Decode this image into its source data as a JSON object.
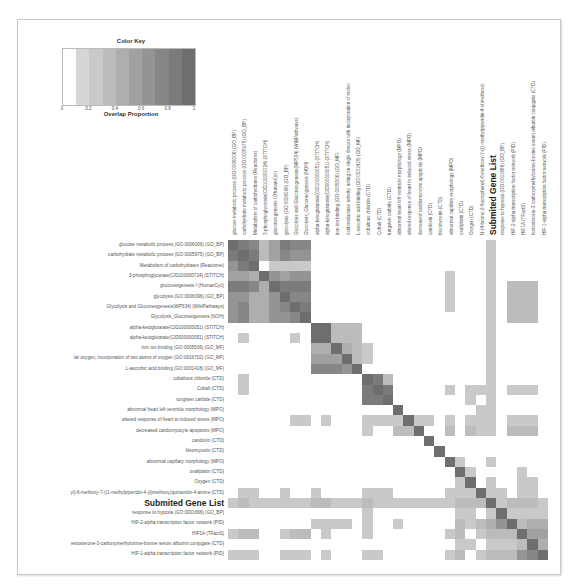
{
  "color_key": {
    "title": "Color Key",
    "xlabel": "Overlap Proportion",
    "ticks": [
      "0",
      "0.2",
      "0.4",
      "0.6",
      "0.8",
      "1"
    ],
    "bins": [
      "#ffffff",
      "#d6d6d6",
      "#c9c9c9",
      "#bcbcbc",
      "#aeaeae",
      "#a1a1a1",
      "#949494",
      "#878787",
      "#7b7b7b",
      "#6e6e6e"
    ]
  },
  "chart_data": {
    "type": "heatmap",
    "title": "",
    "xlabel": "",
    "ylabel": "",
    "legend": {
      "title": "Color Key",
      "label": "Overlap Proportion",
      "range": [
        0,
        1
      ],
      "position": "top-left"
    },
    "labels": [
      "glucose metabolic process (GO:0006006) (GO_BP)",
      "carbohydrate metabolic process (GO:0005975) (GO_BP)",
      "Metabolism of carbohydrates (Reactome)",
      "3-phosphoglycerate(CID100000724) (STITCH)",
      "gluconeogenesis I (HumanCyc)",
      "glycolysis (GO:0006096) (GO_BP)",
      "Glycolysis and Gluconeogenesis(WP534) (WikiPathways)",
      "Glycolysis_Gluconeogenesis (NOH)",
      "alpha-ketoglutarate(CID100000051) (STITCH)",
      "alpha-ketoglutarate(CID000000051) (STITCH)",
      "iron ion binding (GO:0005506) (GO_MF)",
      "oxidoreductase activity, acting on single donors with incorporation of molecular oxygen, incorporation of two atoms of oxygen (GO:0016702) (GO_MF)",
      "L-ascorbic acid binding (GO:0031418) (GO_MF)",
      "cobaltous chloride (CTD)",
      "Cobalt (CTD)",
      "tungsten carbide (CTD)",
      "abnormal heart left ventricle morphology (MPO)",
      "altered response of heart to induced stress (MPO)",
      "decreased cardiomyocyte apoptosis (MPO)",
      "candoxin (CTD)",
      "bleomycetin (CTD)",
      "abnormal capillary morphology (MPO)",
      "oxaliplatin (CTD)",
      "Oxygen (CTD)",
      "N-(4-bromo-2-fluorophenyl)-6-methoxy-7-((1-methylpiperidin-4-yl)methoxy)quinazolin-4-amine (CTD)",
      "Submited Gene List",
      "response to hypoxia (GO:0001666) (GO_BP)",
      "HIF-2-alpha transcription factor network (PID)",
      "HIF1A (TFactS)",
      "testosterone-3-carboxymethyloxime-bovine serum albumin conjugate (CTD)",
      "HIF-1-alpha transcription factor network (PID)"
    ],
    "row_labels_display": [
      "glucose metabolic process (GO:0006006) (GO_BP)",
      "carbohydrate metabolic process (GO:0005975) (GO_BP)",
      "Metabolism of carbohydrates (Reactome)",
      "3-phosphoglycerate(CID100000724) (STITCH)",
      "gluconeogenesis I (HumanCyc)",
      "glycolysis (GO:0006096) (GO_BP)",
      "Glycolysis and Gluconeogenesis(WP534) (WikiPathways)",
      "Glycolysis_Gluconeogenesis (NOH)",
      "alpha-ketoglutarate(CID100000051) (STITCH)",
      "alpha-ketoglutarate(CID000000051) (STITCH)",
      "iron ion binding (GO:0005506) (GO_MF)",
      "lar oxygen, incorporation of two atoms of oxygen (GO:0016702) (GO_MF)",
      "L-ascorbic acid binding (GO:0031418) (GO_MF)",
      "cobaltous chloride (CTD)",
      "Cobalt (CTD)",
      "tungsten carbide (CTD)",
      "abnormal heart left ventricle morphology (MPO)",
      "altered response of heart to induced stress (MPO)",
      "decreased cardiomyocyte apoptosis (MPO)",
      "candoxin (CTD)",
      "bleomycetin (CTD)",
      "abnormal capillary morphology (MPO)",
      "oxaliplatin (CTD)",
      "Oxygen (CTD)",
      "yl)-6-methoxy-7-((1-methylpiperidin-4-yl)methoxy)quinazolin-4-amine (CTD)",
      "Submited Gene List",
      "response to hypoxia (GO:0001666) (GO_BP)",
      "HIF-2-alpha transcription factor network (PID)",
      "HIF1A (TFactS)",
      "estosterone-3-carboxymethyloxime-bovine serum albumin conjugate (CTD)",
      "HIF-1-alpha transcription factor network (PID)"
    ],
    "col_labels_display": [
      "glucose metabolic process (GO:0006006) (GO_BP)",
      "carbohydrate metabolic process (GO:0005975) (GO_BP)",
      "Metabolism of carbohydrates (Reactome)",
      "3-phosphoglycerate(CID100000724) (STITCH)",
      "gluconeogenesis I (HumanCyc)",
      "glycolysis (GO:0006096) (GO_BP)",
      "Glycolysis and Gluconeogenesis(WP534) (WikiPathways)",
      "Glycolysis_Gluconeogenesis (NOH)",
      "alpha-ketoglutarate(CID100000051) (STITCH)",
      "alpha-ketoglutarate(CID000000051) (STITCH)",
      "iron ion binding (GO:0005506) (GO_MF)",
      "oxidoreductase activity, acting on single donors with incorporation of molec",
      "L-ascorbic acid binding (GO:0031418) (GO_MF)",
      "cobaltous chloride (CTD)",
      "Cobalt (CTD)",
      "tungsten carbide (CTD)",
      "abnormal heart left ventricle morphology (MPO)",
      "altered response of heart to induced stress (MPO)",
      "decreased cardiomyocyte apoptosis (MPO)",
      "candoxin (CTD)",
      "bleomycetin (CTD)",
      "abnormal capillary morphology (MPO)",
      "oxaliplatin (CTD)",
      "Oxygen (CTD)",
      "N-(4-bromo-2-fluorophenyl)-6-methoxy-7-((1-methylpiperidin-4-yl)methoxy)",
      "Submited Gene List",
      "response to hypoxia (GO:0001666) (GO_BP)",
      "HIF-2-alpha transcription factor network (PID)",
      "HIF1A (TFactS)",
      "testosterone-3-carboxymethyloxime-bovine serum albumin conjugate (CTD)",
      "HIF-1-alpha transcription factor network (PID)"
    ],
    "highlight_label": "Submited Gene List",
    "values": [
      [
        1.0,
        0.8,
        0.7,
        0.3,
        0.5,
        0.8,
        0.7,
        0.7,
        0,
        0,
        0,
        0,
        0,
        0,
        0,
        0,
        0,
        0,
        0,
        0,
        0,
        0,
        0,
        0,
        0,
        0.2,
        0,
        0,
        0,
        0,
        0
      ],
      [
        0.8,
        1.0,
        0.8,
        0.3,
        0.5,
        0.7,
        0.6,
        0.6,
        0,
        0,
        0,
        0,
        0,
        0,
        0,
        0,
        0,
        0,
        0,
        0,
        0,
        0,
        0,
        0,
        0,
        0.2,
        0,
        0,
        0,
        0,
        0
      ],
      [
        0.6,
        0.8,
        1.0,
        0,
        0.2,
        0.2,
        0.2,
        0.2,
        0,
        0,
        0,
        0,
        0,
        0,
        0,
        0,
        0,
        0,
        0,
        0,
        0,
        0,
        0,
        0,
        0,
        0.2,
        0,
        0,
        0,
        0,
        0
      ],
      [
        0.5,
        0.5,
        0.4,
        1.0,
        0.6,
        0.5,
        0.6,
        0.6,
        0,
        0,
        0,
        0,
        0,
        0,
        0,
        0,
        0,
        0,
        0,
        0,
        0,
        0.2,
        0,
        0,
        0,
        0.2,
        0,
        0,
        0,
        0,
        0
      ],
      [
        0.8,
        0.8,
        0.7,
        0.4,
        1.0,
        0.8,
        0.8,
        0.8,
        0,
        0,
        0,
        0,
        0,
        0,
        0,
        0,
        0,
        0,
        0,
        0,
        0,
        0.2,
        0,
        0,
        0,
        0.2,
        0,
        0.3,
        0.3,
        0.3,
        0
      ],
      [
        0.6,
        0.6,
        0.4,
        0.4,
        0.6,
        1.0,
        0.7,
        0.7,
        0,
        0,
        0,
        0,
        0,
        0,
        0,
        0,
        0,
        0,
        0,
        0,
        0,
        0.2,
        0,
        0,
        0,
        0.2,
        0,
        0.3,
        0.3,
        0.3,
        0
      ],
      [
        0.6,
        0.7,
        0.4,
        0.4,
        0.6,
        0.7,
        1.0,
        0.8,
        0,
        0,
        0,
        0,
        0,
        0,
        0,
        0,
        0,
        0,
        0,
        0,
        0,
        0.2,
        0,
        0,
        0,
        0.2,
        0,
        0.3,
        0.3,
        0.3,
        0
      ],
      [
        0.6,
        0.7,
        0.4,
        0.4,
        0.6,
        0.6,
        0.7,
        1.0,
        0,
        0,
        0,
        0,
        0,
        0,
        0,
        0,
        0,
        0,
        0,
        0,
        0,
        0,
        0,
        0,
        0,
        0.2,
        0,
        0.3,
        0.3,
        0.3,
        0
      ],
      [
        0,
        0,
        0,
        0,
        0,
        0,
        0,
        0,
        1.0,
        0.9,
        0.3,
        0.3,
        0.3,
        0,
        0,
        0,
        0,
        0,
        0,
        0,
        0,
        0,
        0,
        0,
        0,
        0.2,
        0,
        0,
        0,
        0,
        0
      ],
      [
        0,
        0.2,
        0,
        0,
        0,
        0,
        0.2,
        0,
        0.9,
        1.0,
        0.3,
        0.3,
        0.3,
        0,
        0,
        0,
        0,
        0,
        0,
        0,
        0,
        0,
        0,
        0,
        0,
        0.2,
        0,
        0,
        0,
        0,
        0
      ],
      [
        0,
        0,
        0,
        0,
        0,
        0,
        0,
        0,
        0.4,
        0.4,
        1.0,
        0.4,
        0.3,
        0.2,
        0,
        0,
        0,
        0,
        0,
        0,
        0,
        0,
        0,
        0,
        0,
        0.2,
        0,
        0,
        0,
        0,
        0
      ],
      [
        0,
        0,
        0,
        0,
        0,
        0,
        0,
        0,
        0.5,
        0.5,
        0.5,
        1.0,
        0.3,
        0.2,
        0,
        0,
        0,
        0,
        0,
        0,
        0,
        0,
        0,
        0,
        0,
        0.2,
        0,
        0,
        0,
        0,
        0
      ],
      [
        0,
        0,
        0,
        0,
        0,
        0,
        0,
        0,
        0.7,
        0.7,
        0.7,
        0.6,
        1.0,
        0,
        0,
        0,
        0,
        0,
        0,
        0,
        0,
        0,
        0,
        0,
        0,
        0.2,
        0,
        0,
        0,
        0,
        0
      ],
      [
        0,
        0.2,
        0,
        0,
        0,
        0,
        0,
        0,
        0,
        0,
        0,
        0,
        0,
        1.0,
        0.8,
        0.3,
        0,
        0,
        0,
        0,
        0,
        0,
        0,
        0,
        0,
        0.2,
        0,
        0,
        0,
        0,
        0
      ],
      [
        0,
        0.2,
        0,
        0,
        0,
        0,
        0,
        0,
        0,
        0,
        0,
        0,
        0,
        0.8,
        1.0,
        0.8,
        0,
        0,
        0,
        0,
        0,
        0.2,
        0,
        0.2,
        0.2,
        0.2,
        0,
        0.2,
        0.2,
        0.2,
        0
      ],
      [
        0,
        0,
        0,
        0,
        0,
        0,
        0,
        0,
        0,
        0,
        0,
        0,
        0,
        0.8,
        0.8,
        1.0,
        0,
        0,
        0,
        0,
        0,
        0,
        0,
        0.2,
        0,
        0.2,
        0,
        0,
        0,
        0,
        0
      ],
      [
        0,
        0,
        0,
        0,
        0,
        0,
        0,
        0,
        0,
        0,
        0,
        0,
        0,
        0,
        0,
        0,
        1.0,
        0,
        0,
        0,
        0,
        0,
        0,
        0,
        0.2,
        0.2,
        0,
        0,
        0,
        0,
        0
      ],
      [
        0,
        0,
        0,
        0,
        0,
        0,
        0.2,
        0.2,
        0,
        0.2,
        0,
        0,
        0,
        0.2,
        0.2,
        0.2,
        0.2,
        1.0,
        0.2,
        0.2,
        0,
        0.2,
        0,
        0.2,
        0.2,
        0.2,
        0,
        0.2,
        0.2,
        0.2,
        0
      ],
      [
        0,
        0,
        0,
        0,
        0,
        0,
        0,
        0,
        0,
        0,
        0,
        0,
        0,
        0.2,
        0,
        0,
        0.3,
        0.3,
        1.0,
        0,
        0,
        0.3,
        0,
        0.3,
        0.2,
        0.2,
        0,
        0.3,
        0.3,
        0.3,
        0
      ],
      [
        0,
        0,
        0,
        0,
        0,
        0,
        0,
        0,
        0,
        0,
        0,
        0,
        0,
        0,
        0,
        0,
        0,
        0,
        0,
        1.0,
        0,
        0,
        0,
        0,
        0,
        0,
        0,
        0,
        0,
        0,
        0
      ],
      [
        0,
        0,
        0,
        0,
        0,
        0,
        0,
        0,
        0,
        0,
        0,
        0,
        0,
        0,
        0,
        0,
        0,
        0,
        0,
        0,
        1.0,
        0,
        0,
        0,
        0,
        0,
        0,
        0,
        0,
        0,
        0
      ],
      [
        0,
        0,
        0,
        0,
        0,
        0,
        0,
        0,
        0,
        0,
        0,
        0,
        0,
        0,
        0,
        0,
        0,
        0,
        0,
        0,
        0,
        1.0,
        0.2,
        0,
        0,
        0.2,
        0,
        0,
        0,
        0,
        0
      ],
      [
        0,
        0,
        0,
        0,
        0,
        0,
        0,
        0,
        0,
        0,
        0,
        0,
        0,
        0,
        0,
        0,
        0,
        0,
        0,
        0,
        0,
        0,
        1.0,
        0.2,
        0,
        0,
        0,
        0,
        0.2,
        0,
        0
      ],
      [
        0,
        0,
        0,
        0,
        0,
        0,
        0,
        0,
        0,
        0,
        0,
        0,
        0,
        0,
        0,
        0,
        0,
        0,
        0,
        0,
        0,
        0,
        0.2,
        1.0,
        0,
        0.2,
        0,
        0,
        0.2,
        0.2,
        0
      ],
      [
        0,
        0.2,
        0.2,
        0,
        0,
        0.2,
        0,
        0,
        0.2,
        0,
        0,
        0,
        0,
        0.2,
        0.2,
        0.2,
        0,
        0,
        0,
        0,
        0,
        0.2,
        0.2,
        0.2,
        1.0,
        0.2,
        0.2,
        0,
        0.2,
        0.2,
        0
      ],
      [
        0.2,
        0.3,
        0.2,
        0.2,
        0.2,
        0.2,
        0.2,
        0.2,
        0.3,
        0.3,
        0.2,
        0.2,
        0.2,
        0.3,
        0.2,
        0.2,
        0.2,
        0.2,
        0.2,
        0.2,
        0.2,
        0.2,
        0.3,
        0.3,
        0.3,
        1.0,
        0.2,
        0.3,
        0.3,
        0.3,
        0.2
      ],
      [
        0,
        0,
        0,
        0,
        0,
        0,
        0,
        0,
        0,
        0,
        0,
        0,
        0,
        0.2,
        0,
        0,
        0,
        0,
        0,
        0,
        0,
        0,
        0.2,
        0.2,
        0,
        0.2,
        1.0,
        0.2,
        0.2,
        0.2,
        0.2
      ],
      [
        0,
        0,
        0,
        0,
        0,
        0,
        0,
        0,
        0.2,
        0.2,
        0.2,
        0.2,
        0,
        0.2,
        0,
        0,
        0.2,
        0,
        0,
        0,
        0,
        0,
        0.3,
        0.2,
        0.3,
        0.4,
        0.6,
        1.0,
        0.3,
        0.4,
        0.4
      ],
      [
        0.2,
        0.3,
        0.3,
        0,
        0,
        0.2,
        0.3,
        0.3,
        0,
        0.2,
        0,
        0,
        0,
        0.2,
        0,
        0,
        0,
        0,
        0,
        0,
        0,
        0.2,
        0.3,
        0,
        0.2,
        0.3,
        0.3,
        0.3,
        1.0,
        0.5,
        0.5
      ],
      [
        0,
        0,
        0,
        0,
        0,
        0,
        0,
        0,
        0,
        0,
        0,
        0,
        0,
        0,
        0,
        0,
        0,
        0,
        0,
        0,
        0,
        0,
        0.2,
        0.2,
        0,
        0.2,
        0.2,
        0.2,
        0.3,
        1.0,
        0.4
      ],
      [
        0.2,
        0.2,
        0.2,
        0,
        0,
        0.2,
        0.2,
        0.2,
        0,
        0.2,
        0,
        0,
        0,
        0.2,
        0.2,
        0,
        0,
        0,
        0,
        0,
        0,
        0.2,
        0.3,
        0,
        0.2,
        0.3,
        0.3,
        0.3,
        0.6,
        0.7,
        1.0
      ]
    ],
    "value_range": [
      0,
      1
    ],
    "grid": false
  }
}
